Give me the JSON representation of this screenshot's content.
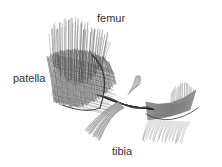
{
  "figure": {
    "type": "anatomical fiber illustration",
    "labels": {
      "femur": "femur",
      "patella": "patella",
      "tibia": "tibia"
    },
    "colors": {
      "background": "#ffffff",
      "ink_dark": "#222222",
      "ink_mid": "#666666",
      "ink_light": "#9a9a9a",
      "label": "#333333"
    }
  }
}
